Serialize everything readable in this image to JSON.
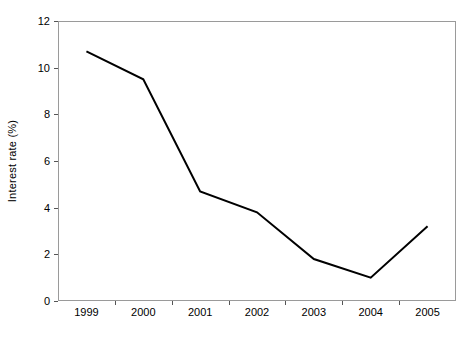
{
  "chart_data": {
    "type": "line",
    "title": "",
    "subtitle": "",
    "xlabel": "",
    "ylabel": "Interest rate (%)",
    "categories": [
      "1999",
      "2000",
      "2001",
      "2002",
      "2003",
      "2004",
      "2005"
    ],
    "series": [
      {
        "name": "Interest rate",
        "values": [
          10.7,
          9.5,
          4.7,
          3.8,
          1.8,
          1.0,
          3.2
        ],
        "color": "#000000",
        "line_width": 2,
        "markers": "none"
      }
    ],
    "x": [
      "1999",
      "2000",
      "2001",
      "2002",
      "2003",
      "2004",
      "2005"
    ],
    "ylim": [
      0,
      12
    ],
    "ytick_values": [
      0,
      2,
      4,
      6,
      8,
      10,
      12
    ],
    "ytick_labels": [
      "0",
      "2",
      "4",
      "6",
      "8",
      "10",
      "12"
    ],
    "xtick_labels": [
      "1999",
      "2000",
      "2001",
      "2002",
      "2003",
      "2004",
      "2005"
    ],
    "grid": false,
    "legend": false,
    "legend_position": "none",
    "annotations": [],
    "axis_color": "#9a9a9a",
    "background": "#ffffff"
  }
}
